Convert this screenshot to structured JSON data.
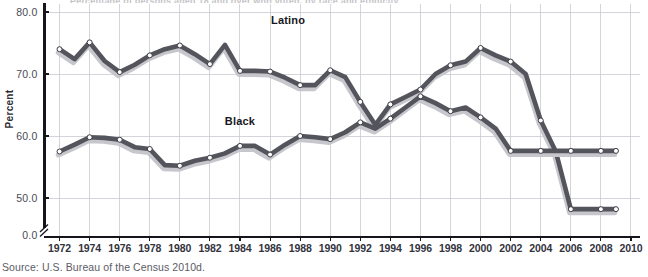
{
  "chart_data": {
    "type": "line",
    "title": "Percentage of persons aged 18 and over who voted, by race and ethnicity",
    "xlabel": "",
    "ylabel": "Percent",
    "xlim": [
      1971,
      2010.6
    ],
    "ylim": [
      44.0,
      81.5
    ],
    "grid": true,
    "y_axis_break": true,
    "y_break_label": "0.0",
    "legend_position": "inline-labels",
    "yticks": [
      "80.0",
      "70.0",
      "60.0",
      "50.0"
    ],
    "ytick_values": [
      80.0,
      70.0,
      60.0,
      50.0
    ],
    "xticks": [
      "1972",
      "1974",
      "1976",
      "1978",
      "1980",
      "1982",
      "1984",
      "1986",
      "1988",
      "1990",
      "1992",
      "1994",
      "1996",
      "1998",
      "2000",
      "2002",
      "2004",
      "2006",
      "2008",
      "2010"
    ],
    "xtick_values": [
      1972,
      1974,
      1976,
      1978,
      1980,
      1982,
      1984,
      1986,
      1988,
      1990,
      1992,
      1994,
      1996,
      1998,
      2000,
      2002,
      2004,
      2006,
      2008,
      2010
    ],
    "x": [
      1972,
      1973,
      1974,
      1975,
      1976,
      1977,
      1978,
      1979,
      1980,
      1981,
      1982,
      1983,
      1984,
      1985,
      1986,
      1987,
      1988,
      1989,
      1990,
      1991,
      1992,
      1993,
      1994,
      1995,
      1996,
      1997,
      1998,
      1999,
      2000,
      2001,
      2002,
      2003,
      2004,
      2005,
      2006,
      2007,
      2008,
      2009
    ],
    "series": [
      {
        "name": "Latino",
        "color": "#54545c",
        "label_x": 1987.2,
        "label_y": 78.0,
        "values": [
          74.0,
          72.4,
          75.1,
          72.1,
          70.3,
          71.5,
          73.0,
          74.0,
          74.6,
          73.2,
          71.6,
          74.7,
          70.5,
          70.5,
          70.4,
          69.4,
          68.2,
          68.2,
          70.6,
          69.5,
          65.5,
          61.8,
          65.1,
          66.3,
          67.5,
          70.0,
          71.4,
          72.0,
          74.2,
          73.0,
          72.0,
          70.0,
          62.5,
          57.5,
          48.2,
          48.2,
          48.2,
          48.2
        ]
      },
      {
        "name": "Black",
        "color": "#54545c",
        "label_x": 1984.0,
        "label_y": 61.8,
        "values": [
          57.5,
          58.6,
          59.8,
          59.7,
          59.4,
          58.2,
          57.9,
          55.3,
          55.2,
          56.0,
          56.5,
          57.2,
          58.4,
          58.4,
          57.0,
          58.6,
          60.0,
          59.8,
          59.5,
          60.6,
          62.2,
          61.2,
          62.8,
          64.6,
          66.4,
          65.3,
          64.0,
          64.6,
          63.0,
          61.2,
          57.6,
          57.6,
          57.6,
          57.6,
          57.6,
          57.6,
          57.6,
          57.6
        ]
      }
    ]
  },
  "caption": {
    "source_text": "Source: U.S. Bureau of the Census 2010d."
  }
}
